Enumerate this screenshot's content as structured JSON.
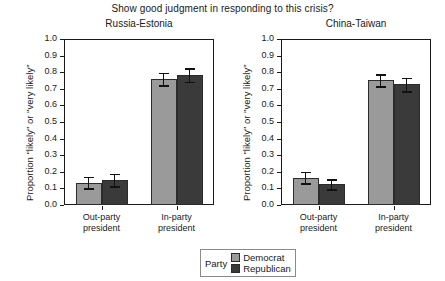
{
  "chart_data": {
    "type": "bar",
    "title": "Show good judgment in responding to this crisis?",
    "xlabel": "",
    "ylabel": "Proportion \"likely\" or \"very likely\"",
    "ylim": [
      0.0,
      1.0
    ],
    "ytick_labels": [
      "0.0",
      "0.1",
      "0.2",
      "0.3",
      "0.4",
      "0.5",
      "0.6",
      "0.7",
      "0.8",
      "0.9",
      "1.0"
    ],
    "ytick_values": [
      0.0,
      0.1,
      0.2,
      0.3,
      0.4,
      0.5,
      0.6,
      0.7,
      0.8,
      0.9,
      1.0
    ],
    "grid": false,
    "legend_position": "bottom-center",
    "legend_title": "Party",
    "categories": [
      "Out-party president",
      "In-party president"
    ],
    "panels": [
      {
        "title": "Russia-Estonia",
        "series": [
          {
            "name": "Democrat",
            "color": "#9a9a9a",
            "values": [
              0.135,
              0.76
            ],
            "errors": [
              0.035,
              0.038
            ]
          },
          {
            "name": "Republican",
            "color": "#3a3a3a",
            "values": [
              0.15,
              0.783
            ],
            "errors": [
              0.038,
              0.04
            ]
          }
        ]
      },
      {
        "title": "China-Taiwan",
        "series": [
          {
            "name": "Democrat",
            "color": "#9a9a9a",
            "values": [
              0.165,
              0.752
            ],
            "errors": [
              0.035,
              0.035
            ]
          },
          {
            "name": "Republican",
            "color": "#3a3a3a",
            "values": [
              0.125,
              0.726
            ],
            "errors": [
              0.03,
              0.042
            ]
          }
        ]
      }
    ],
    "series_names": [
      "Democrat",
      "Republican"
    ],
    "series_colors": [
      "#9a9a9a",
      "#3a3a3a"
    ]
  },
  "figure": {
    "title": "Show good judgment in responding to this crisis?"
  },
  "legend": {
    "title": "Party",
    "items": [
      {
        "label": "Democrat",
        "color": "#9a9a9a"
      },
      {
        "label": "Republican",
        "color": "#3a3a3a"
      }
    ]
  },
  "axis": {
    "ylabel": "Proportion \"likely\" or \"very likely\"",
    "xcat_line1": [
      "Out-party",
      "In-party"
    ],
    "xcat_line2": [
      "president",
      "president"
    ]
  }
}
